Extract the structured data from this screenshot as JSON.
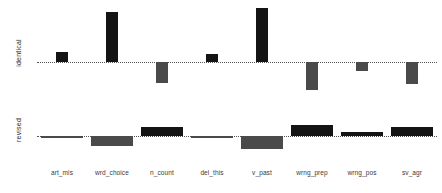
{
  "chart_data": {
    "type": "bar",
    "title": "",
    "xlabel": "",
    "categories": [
      "art_mis",
      "wrd_choice",
      "n_count",
      "del_this",
      "v_past",
      "wrng_prep",
      "wrng_pos",
      "sv_agr"
    ],
    "grid": false,
    "legend": "none",
    "panels": [
      {
        "name": "identical",
        "ylabel": "identical",
        "ylim": [
          -0.55,
          1.05
        ],
        "zero_line": true,
        "values": [
          0.18,
          0.92,
          -0.38,
          0.14,
          1.0,
          -0.52,
          -0.17,
          -0.4
        ]
      },
      {
        "name": "revised",
        "ylabel": "revised",
        "ylim": [
          -0.3,
          0.3
        ],
        "zero_line": true,
        "values": [
          -0.03,
          -0.16,
          0.14,
          -0.02,
          -0.21,
          0.18,
          0.07,
          0.15
        ]
      }
    ]
  },
  "axes": {
    "identical_label": "identical",
    "revised_label": "revised"
  },
  "ticks": {
    "art_mis": "art_mis",
    "wrd_choice": "wrd_choice",
    "n_count": "n_count",
    "del_this": "del_this",
    "v_past": "v_past",
    "wrng_prep": "wrng_prep",
    "wrng_pos": "wrng_pos",
    "sv_agr": "sv_agr"
  },
  "colors": {
    "bar_positive": "#141414",
    "bar_negative": "#4a4a4a",
    "baseline": "#555555",
    "background": "#ffffff",
    "text": "#2b2b2b"
  }
}
